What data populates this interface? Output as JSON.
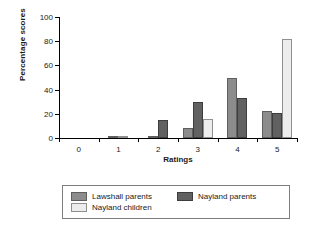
{
  "chart_data": {
    "type": "bar",
    "title": "",
    "xlabel": "Ratings",
    "ylabel": "Percentage scores",
    "categories": [
      "0",
      "1",
      "2",
      "3",
      "4",
      "5"
    ],
    "ylim": [
      0,
      100
    ],
    "yticks": [
      "0",
      "20",
      "40",
      "60",
      "80",
      "100"
    ],
    "grid": false,
    "legend_position": "bottom",
    "series": [
      {
        "name": "Lawshall parents",
        "color": "#8c8c8c",
        "values": [
          0,
          2,
          2,
          8,
          50,
          22
        ]
      },
      {
        "name": "Nayland parents",
        "color": "#616161",
        "values": [
          0,
          0,
          15,
          30,
          33,
          21
        ]
      },
      {
        "name": "Nayland children",
        "color": "#ededed",
        "values": [
          0,
          2,
          0,
          16,
          0,
          82
        ]
      }
    ]
  }
}
